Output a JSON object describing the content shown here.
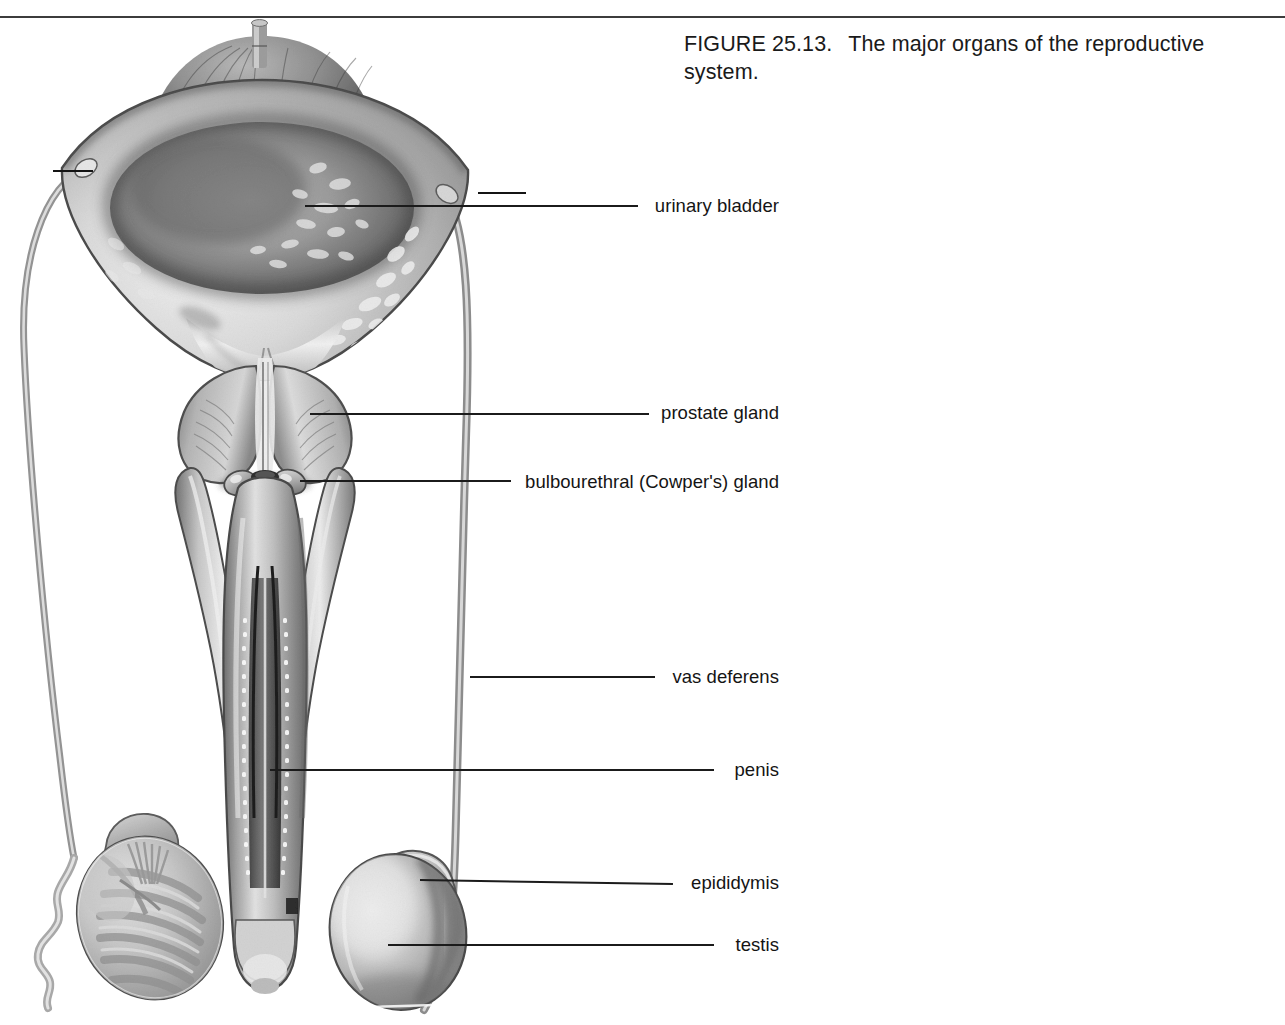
{
  "page": {
    "width": 1285,
    "height": 1025,
    "background": "#ffffff",
    "rule_color": "#3c3c3c"
  },
  "caption": {
    "figure_number": "FIGURE 25.13.",
    "text": "The major organs of the reproductive system."
  },
  "figure": {
    "type": "anatomical-illustration",
    "style": "grayscale pencil/airbrush rendering",
    "ink_color": "#1b1b1b"
  },
  "labels": [
    {
      "id": "urinary-bladder",
      "text": "urinary bladder",
      "text_right_x": 779,
      "text_baseline_y": 212,
      "leader": {
        "x1": 305,
        "y1": 206,
        "x2": 638,
        "y2": 206
      }
    },
    {
      "id": "prostate-gland",
      "text": "prostate gland",
      "text_right_x": 779,
      "text_baseline_y": 419,
      "leader": {
        "x1": 310,
        "y1": 414,
        "x2": 649,
        "y2": 414
      }
    },
    {
      "id": "bulbourethral-gland",
      "text": "bulbourethral (Cowper's) gland",
      "text_right_x": 779,
      "text_baseline_y": 488,
      "leader": {
        "x1": 300,
        "y1": 481,
        "x2": 511,
        "y2": 481
      }
    },
    {
      "id": "vas-deferens",
      "text": "vas deferens",
      "text_right_x": 779,
      "text_baseline_y": 683,
      "leader": {
        "x1": 470,
        "y1": 677,
        "x2": 655,
        "y2": 677
      }
    },
    {
      "id": "penis",
      "text": "penis",
      "text_right_x": 779,
      "text_baseline_y": 776,
      "leader": {
        "x1": 270,
        "y1": 770,
        "x2": 714,
        "y2": 770
      }
    },
    {
      "id": "epididymis",
      "text": "epididymis",
      "text_right_x": 779,
      "text_baseline_y": 889,
      "leader": {
        "x1": 420,
        "y1": 880,
        "x2": 673,
        "y2": 884
      }
    },
    {
      "id": "testis",
      "text": "testis",
      "text_right_x": 779,
      "text_baseline_y": 951,
      "leader": {
        "x1": 388,
        "y1": 945,
        "x2": 714,
        "y2": 945
      }
    }
  ],
  "markers": [
    {
      "id": "ureter-left-tick",
      "x": 53,
      "y": 171,
      "width": 40
    },
    {
      "id": "ureter-right-tick",
      "x": 478,
      "y": 193,
      "width": 48
    }
  ]
}
